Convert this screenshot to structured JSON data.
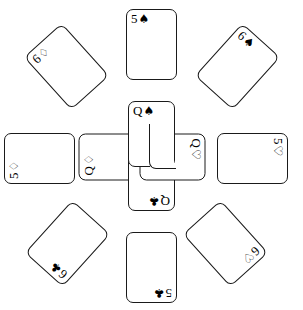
{
  "scene": {
    "title": "Playing card pinwheel layout",
    "background_color": "#ffffff",
    "ink_color": "#1a1a1a",
    "card_face_color": "#ffffff",
    "card_count": 12
  },
  "suit_glyphs": {
    "spades": "♠",
    "hearts": "♡",
    "diamonds": "♢",
    "clubs": "♣"
  },
  "center": {
    "name": "four-queens-pinwheel",
    "cards": [
      {
        "id": "queen-spades",
        "rank": "Q",
        "suit": "spades",
        "suit_glyph": "♠",
        "label": "Q♠",
        "position": "top",
        "rotation_deg": 0
      },
      {
        "id": "queen-hearts",
        "rank": "Q",
        "suit": "hearts",
        "suit_glyph": "♡",
        "label": "Q♡",
        "position": "right",
        "rotation_deg": 90
      },
      {
        "id": "queen-clubs",
        "rank": "Q",
        "suit": "clubs",
        "suit_glyph": "♣",
        "label": "Q♣",
        "position": "bottom",
        "rotation_deg": 180
      },
      {
        "id": "queen-diamonds",
        "rank": "Q",
        "suit": "diamonds",
        "suit_glyph": "♢",
        "label": "Q♢",
        "position": "left",
        "rotation_deg": 270
      }
    ]
  },
  "ring": {
    "name": "outer-ring-eight-cards",
    "cards": [
      {
        "id": "five-spades",
        "rank": "5",
        "suit": "spades",
        "suit_glyph": "♠",
        "label": "5♠",
        "position": "north",
        "rotation_deg": 0
      },
      {
        "id": "six-spades",
        "rank": "6",
        "suit": "spades",
        "suit_glyph": "♠",
        "label": "6♠",
        "position": "northeast",
        "rotation_deg": 42
      },
      {
        "id": "five-hearts",
        "rank": "5",
        "suit": "hearts",
        "suit_glyph": "♡",
        "label": "5♡",
        "position": "east",
        "rotation_deg": 90
      },
      {
        "id": "six-hearts",
        "rank": "6",
        "suit": "hearts",
        "suit_glyph": "♡",
        "label": "6♡",
        "position": "southeast",
        "rotation_deg": 138
      },
      {
        "id": "five-clubs",
        "rank": "5",
        "suit": "clubs",
        "suit_glyph": "♣",
        "label": "5♣",
        "position": "south",
        "rotation_deg": 180
      },
      {
        "id": "six-clubs",
        "rank": "6",
        "suit": "clubs",
        "suit_glyph": "♣",
        "label": "6♣",
        "position": "southwest",
        "rotation_deg": 222
      },
      {
        "id": "five-diamonds",
        "rank": "5",
        "suit": "diamonds",
        "suit_glyph": "♢",
        "label": "5♢",
        "position": "west",
        "rotation_deg": 270
      },
      {
        "id": "six-diamonds",
        "rank": "6",
        "suit": "diamonds",
        "suit_glyph": "♢",
        "label": "6♢",
        "position": "northwest",
        "rotation_deg": 318
      }
    ]
  }
}
